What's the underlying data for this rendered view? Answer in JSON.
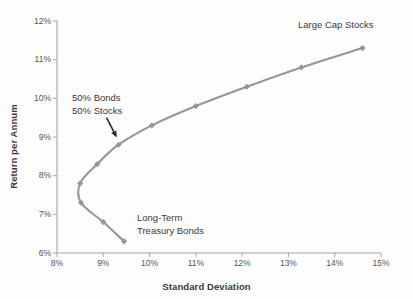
{
  "chart_data": {
    "type": "line",
    "title": "",
    "xlabel": "Standard Deviation",
    "ylabel": "Return per Annum",
    "xlim": [
      8,
      15
    ],
    "ylim": [
      6,
      12
    ],
    "xticks": [
      "8%",
      "9%",
      "10%",
      "11%",
      "12%",
      "13%",
      "14%",
      "15%"
    ],
    "xtick_values": [
      8,
      9,
      10,
      11,
      12,
      13,
      14,
      15
    ],
    "yticks": [
      "6%",
      "7%",
      "8%",
      "9%",
      "10%",
      "11%",
      "12%"
    ],
    "ytick_values": [
      6,
      7,
      8,
      9,
      10,
      11,
      12
    ],
    "grid": false,
    "legend": "none",
    "series": [
      {
        "name": "Efficient frontier",
        "color": "#969696",
        "marker": "diamond",
        "x": [
          9.45,
          9.0,
          8.52,
          8.5,
          8.87,
          9.33,
          10.05,
          11.0,
          12.1,
          13.28,
          14.6
        ],
        "y": [
          6.3,
          6.8,
          7.3,
          7.8,
          8.3,
          8.8,
          9.3,
          9.8,
          10.3,
          10.8,
          11.3
        ]
      }
    ],
    "annotations": [
      {
        "name": "large-cap-stocks",
        "text": "Large Cap Stocks",
        "x": 14.6,
        "y": 11.3
      },
      {
        "name": "balanced-portfolio",
        "line1": "50% Bonds",
        "line2": "50% Stocks",
        "x": 9.33,
        "y": 8.8,
        "has_arrow": true
      },
      {
        "name": "long-term-treasury-bonds",
        "line1": "Long-Term",
        "line2": "Treasury Bonds",
        "x": 9.45,
        "y": 6.3
      }
    ]
  },
  "axes": {
    "x_title": "Standard Deviation",
    "y_title": "Return per Annum"
  },
  "annotation_text": {
    "large_cap": "Large Cap Stocks",
    "balanced_line1": "50% Bonds",
    "balanced_line2": "50% Stocks",
    "bonds_line1": "Long-Term",
    "bonds_line2": "Treasury Bonds"
  },
  "colors": {
    "series": "#969696",
    "axis": "#a6a6a6",
    "text": "#3a3a3a",
    "tick_text": "#555555",
    "background": "#fdfdfd"
  }
}
